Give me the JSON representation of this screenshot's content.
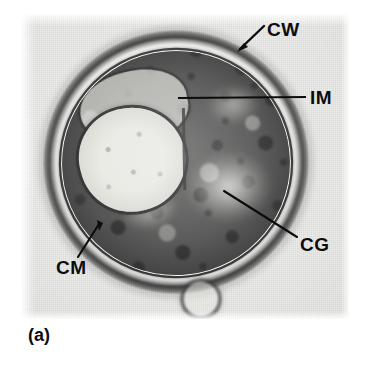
{
  "figure": {
    "caption": "(a)",
    "type": "transmission-electron-micrograph"
  },
  "labels": [
    {
      "id": "cw",
      "text": "CW",
      "meaning": "cell wall",
      "leader": "arrow",
      "x": 267,
      "y": 20
    },
    {
      "id": "im",
      "text": "IM",
      "meaning": "intracytoplasmic membrane",
      "leader": "line",
      "x": 310,
      "y": 88
    },
    {
      "id": "cg",
      "text": "CG",
      "meaning": "cytoplasmic granules",
      "leader": "line",
      "x": 300,
      "y": 235
    },
    {
      "id": "cm",
      "text": "CM",
      "meaning": "cytoplasmic membrane",
      "leader": "line",
      "x": 56,
      "y": 258
    }
  ],
  "colors": {
    "plate_background": "#e9e9e7",
    "page_background": "#ffffff",
    "ink": "#0c0c0c",
    "cytoplasm_dark": "#1a1a1a",
    "periplasm_light": "#f6f6f4"
  }
}
